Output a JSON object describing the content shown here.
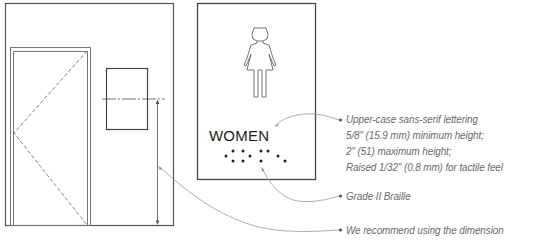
{
  "sign": {
    "label": "WOMEN",
    "pictogram": "woman-figure-icon",
    "braille_dots": [
      [
        226,
        156
      ],
      [
        233,
        151
      ],
      [
        233,
        161
      ],
      [
        243,
        151
      ],
      [
        243,
        161
      ],
      [
        250,
        156
      ],
      [
        261,
        151
      ],
      [
        268,
        151
      ],
      [
        261,
        161
      ],
      [
        278,
        156
      ],
      [
        285,
        161
      ]
    ]
  },
  "callouts": [
    {
      "id": "lettering",
      "lines": [
        "Upper-case sans-serif lettering",
        "5/8\" (15.9 mm) minimum height;",
        "2\" (51) maximum height;",
        "Raised 1/32\" (0.8 mm) for tactile feel"
      ]
    },
    {
      "id": "braille",
      "lines": [
        "Grade II Braille"
      ]
    },
    {
      "id": "dimension",
      "lines": [
        "We recommend using the dimension"
      ]
    }
  ],
  "colors": {
    "line": "#444444",
    "leader": "#9a9a9a",
    "text": "#6a6a6a"
  }
}
